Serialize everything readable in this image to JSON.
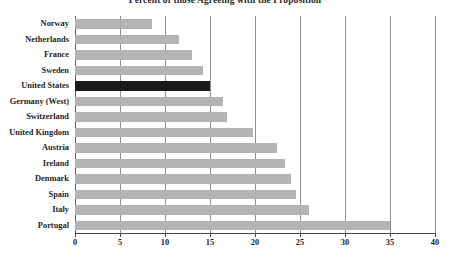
{
  "chart_data": {
    "type": "bar",
    "orientation": "horizontal",
    "title": "Percent of those Agreeing with the Proposition",
    "xlabel": "",
    "ylabel": "",
    "xlim": [
      0,
      40
    ],
    "xticks": [
      0,
      5,
      10,
      15,
      20,
      25,
      30,
      35,
      40
    ],
    "grid": true,
    "legend": "none",
    "categories": [
      "Norway",
      "Netherlands",
      "France",
      "Sweden",
      "United States",
      "Germany (West)",
      "Switzerland",
      "United Kingdom",
      "Austria",
      "Ireland",
      "Denmark",
      "Spain",
      "Italy",
      "Portugal"
    ],
    "values": [
      8.6,
      11.6,
      13.0,
      14.2,
      15.0,
      16.4,
      16.9,
      19.8,
      22.4,
      23.3,
      24.0,
      24.5,
      26.0,
      35.0
    ],
    "highlight_category": "United States",
    "colors": {
      "bar": "#b4b4b4",
      "bar_highlight": "#1a1a1a",
      "gridline": "#8f8f8f",
      "axis": "#4a4a4a",
      "text": "#1f1f1f",
      "background": "#ffffff"
    }
  }
}
